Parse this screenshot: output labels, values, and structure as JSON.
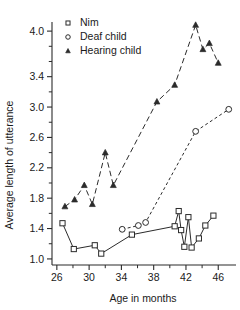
{
  "chart_data": {
    "type": "line",
    "title": "",
    "xlabel": "Age in months",
    "ylabel": "Average length of utterance",
    "xlim": [
      25.4,
      48.2
    ],
    "ylim": [
      0.92,
      4.12
    ],
    "grid": false,
    "legend_position": "top-left",
    "x_ticks": [
      26,
      30,
      34,
      38,
      42,
      46
    ],
    "x_tick_labels": [
      "26",
      "30",
      "34",
      "38",
      "42",
      "46"
    ],
    "x_minor_ticks": [
      28,
      32,
      36,
      40,
      44
    ],
    "y_ticks": [
      1.0,
      1.4,
      1.8,
      2.2,
      2.6,
      3.0,
      3.4,
      4.0
    ],
    "y_tick_labels": [
      "1.0",
      "1.4",
      "1.8",
      "2.2",
      "2.6",
      "3.0",
      "3.4",
      "4.0"
    ],
    "y_minor_ticks": [
      1.2,
      1.6,
      2.0,
      2.4,
      2.8,
      3.2,
      3.6,
      3.8
    ],
    "series": [
      {
        "name": "Nim",
        "marker": "open-square",
        "line_style": "solid",
        "points": [
          [
            26.7,
            1.47
          ],
          [
            28.1,
            1.13
          ],
          [
            30.7,
            1.18
          ],
          [
            31.5,
            1.07
          ],
          [
            35.3,
            1.32
          ],
          [
            40.6,
            1.43
          ],
          [
            41.1,
            1.63
          ],
          [
            41.4,
            1.38
          ],
          [
            41.8,
            1.16
          ],
          [
            42.3,
            1.55
          ],
          [
            42.7,
            1.15
          ],
          [
            43.6,
            1.27
          ],
          [
            44.4,
            1.44
          ],
          [
            45.4,
            1.57
          ]
        ]
      },
      {
        "name": "Deaf child",
        "marker": "open-circle",
        "line_style": "dashed-short",
        "points": [
          [
            34.1,
            1.39
          ],
          [
            36.1,
            1.44
          ],
          [
            37.0,
            1.48
          ],
          [
            43.2,
            2.68
          ],
          [
            47.3,
            2.97
          ]
        ]
      },
      {
        "name": "Hearing child",
        "marker": "filled-triangle",
        "line_style": "dashed-long",
        "points": [
          [
            27.0,
            1.69
          ],
          [
            28.2,
            1.78
          ],
          [
            29.4,
            1.97
          ],
          [
            30.4,
            1.72
          ],
          [
            32.0,
            2.4
          ],
          [
            33.0,
            1.97
          ],
          [
            38.4,
            3.07
          ],
          [
            40.6,
            3.29
          ],
          [
            43.2,
            4.08
          ],
          [
            44.1,
            3.76
          ],
          [
            44.9,
            3.84
          ],
          [
            46.0,
            3.58
          ]
        ]
      }
    ],
    "legend_entries": [
      {
        "label": "Nim",
        "marker": "open-square"
      },
      {
        "label": "Deaf child",
        "marker": "open-circle"
      },
      {
        "label": "Hearing child",
        "marker": "filled-triangle"
      }
    ]
  },
  "colors": {
    "foreground": "#2b2b2b",
    "background": "#ffffff"
  }
}
